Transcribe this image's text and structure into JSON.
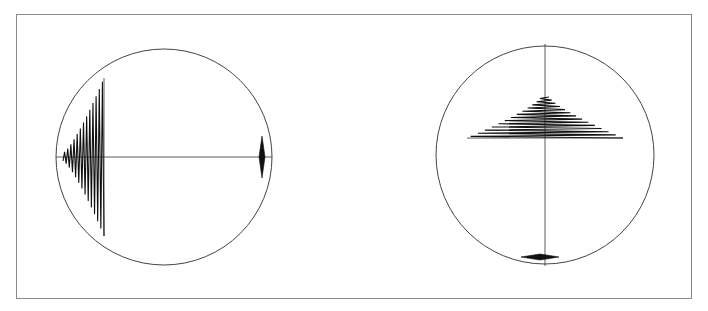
{
  "figure": {
    "width": 708,
    "height": 311,
    "frame": {
      "x": 16,
      "y": 14,
      "width": 675,
      "height": 284,
      "stroke": "#8a8a8a"
    },
    "colors": {
      "ink": "#111111",
      "circle": "#444444",
      "background": "#ffffff"
    },
    "panels": [
      {
        "id": "left",
        "orientation": "horizontal",
        "circle": {
          "cx": 164,
          "cy": 157,
          "r": 108
        },
        "axis": {
          "x1": 56,
          "y1": 157,
          "x2": 272,
          "y2": 157
        },
        "pattern": {
          "kind": "growing-zigzag",
          "start": 63,
          "end": 104,
          "centerline": 157,
          "min_amplitude": 4,
          "max_amplitude": 79,
          "cycles": 13
        },
        "marker": {
          "kind": "diamond",
          "cx": 262,
          "cy": 157,
          "half_width": 3,
          "half_height": 21
        }
      },
      {
        "id": "right",
        "orientation": "vertical",
        "circle": {
          "cx": 545,
          "cy": 155,
          "r": 109
        },
        "axis": {
          "x1": 545,
          "y1": 44,
          "x2": 545,
          "y2": 266
        },
        "pattern": {
          "kind": "growing-zigzag",
          "start": 51,
          "end": 92,
          "centerline": 545,
          "min_amplitude": 4,
          "max_amplitude": 78,
          "cycles": 13
        },
        "marker": {
          "kind": "diamond",
          "cx": 540,
          "cy": 257,
          "half_width": 19,
          "half_height": 3
        }
      }
    ]
  }
}
